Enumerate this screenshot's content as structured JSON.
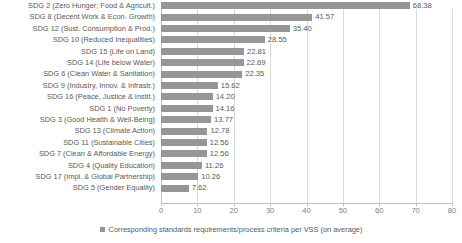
{
  "chart_data": {
    "type": "bar",
    "orientation": "horizontal",
    "title": "",
    "xlabel": "",
    "ylabel": "",
    "xlim": [
      0,
      80
    ],
    "xticks": [
      0,
      10,
      20,
      30,
      40,
      50,
      60,
      70,
      80
    ],
    "grid": "vertical",
    "legend_position": "bottom",
    "series": [
      {
        "name": "Corresponding standards requirements/process criteria per VSS (on average)",
        "color": "#969696",
        "values": [
          68.38,
          41.57,
          35.4,
          28.55,
          22.81,
          22.69,
          22.35,
          15.62,
          14.2,
          14.16,
          13.77,
          12.78,
          12.56,
          12.56,
          11.26,
          10.26,
          7.62
        ]
      }
    ],
    "categories": [
      "SDG 2 (Zero Hunger; Food & Agricult.)",
      "SDG 8 (Decent Work & Econ. Growth)",
      "SDG 12 (Sust. Consumption & Prod.)",
      "SDG 10 (Reduced Inequalities)",
      "SDG 15 (Life on Land)",
      "SDG 14 (Life below Water)",
      "SDG 6 (Clean Water & Sanitation)",
      "SDG 9 (Industry, Innov. & Infrastr.)",
      "SDG 16 (Peace, Justice & Instit.)",
      "SDG 1 (No Poverty)",
      "SDG 3 (Good Health & Well-Being)",
      "SDG 13 (Climate Action)",
      "SDG 11 (Sustainable Cities)",
      "SDG 7 (Clean & Affordable Energy)",
      "SDG 4 (Quality Education)",
      "SDG 17 (Impl. & Global Partnership)",
      "SDG 5 (Gender Equality)"
    ],
    "value_labels": [
      "68.38",
      "41.57",
      "35.40",
      "28.55",
      "22.81",
      "22.69",
      "22.35",
      "15.62",
      "14.20",
      "14.16",
      "13.77",
      "12.78",
      "12.56",
      "12.56",
      "11.26",
      "10.26",
      "7.62"
    ],
    "tick_labels": [
      "0",
      "10",
      "20",
      "30",
      "40",
      "50",
      "60",
      "70",
      "80"
    ]
  },
  "legend": {
    "entries": [
      {
        "label": "Corresponding standards requirements/process criteria per VSS (on average)",
        "color": "#969696"
      }
    ]
  }
}
